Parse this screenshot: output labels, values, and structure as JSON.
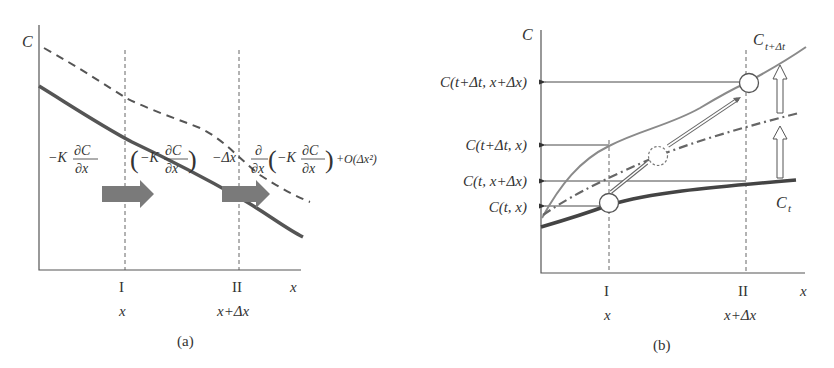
{
  "panel_a": {
    "caption": "(a)",
    "y_axis_label": "C",
    "x_axis_label": "x",
    "section_I": {
      "roman": "I",
      "position": "x"
    },
    "section_II": {
      "roman": "II",
      "position": "x+Δx"
    },
    "flux_in": {
      "prefix": "−K",
      "num": "∂C",
      "den": "∂x"
    },
    "flux_out": {
      "paren_prefix": "−K",
      "paren_num": "∂C",
      "paren_den": "∂x",
      "minus_dx": "−Δx",
      "deriv_num": "∂",
      "deriv_den": "∂x",
      "inner_prefix": "−K",
      "inner_num": "∂C",
      "inner_den": "∂x",
      "remainder": "+O(Δx²)"
    },
    "curves": [
      {
        "name": "concentration-solid",
        "style": "solid thick",
        "color": "#555555"
      },
      {
        "name": "concentration-dashed",
        "style": "dashed",
        "color": "#555555"
      }
    ],
    "flux_arrow_color": "#7a7a7a"
  },
  "panel_b": {
    "caption": "(b)",
    "y_axis_label": "C",
    "x_axis_label": "x",
    "section_I": {
      "roman": "I",
      "position": "x"
    },
    "section_II": {
      "roman": "II",
      "position": "x+Δx"
    },
    "value_labels": [
      "C(t+Δt, x+Δx)",
      "C(t+Δt, x)",
      "C(t, x+Δx)",
      "C(t, x)"
    ],
    "curve_labels": {
      "later": {
        "base": "C",
        "sub": "t+Δt"
      },
      "current": {
        "base": "C",
        "sub": "t"
      }
    },
    "curves": [
      {
        "name": "C_t",
        "style": "solid thick",
        "color": "#444444"
      },
      {
        "name": "C_t+dt",
        "style": "solid thin",
        "color": "#8a8a8a"
      },
      {
        "name": "intermediate",
        "style": "dash-dot",
        "color": "#666666"
      }
    ]
  }
}
